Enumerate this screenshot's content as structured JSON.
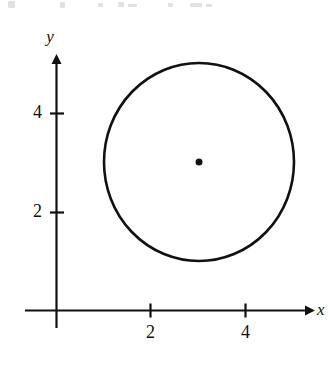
{
  "figure": {
    "background_color": "#ffffff",
    "ink_color": "#111111",
    "width": 335,
    "height": 368
  },
  "axes": {
    "x_axis_label": "x",
    "y_axis_label": "y",
    "x_ticks": [
      {
        "label": "2",
        "value": 2
      },
      {
        "label": "4",
        "value": 4
      }
    ],
    "y_ticks": [
      {
        "label": "2",
        "value": 2
      },
      {
        "label": "4",
        "value": 4
      }
    ],
    "origin_label": "",
    "x_arrowhead": "arrow-right",
    "y_arrowhead": "arrow-up"
  },
  "chart_data": {
    "type": "scatter",
    "xlabel": "x",
    "ylabel": "y",
    "xlim": [
      -0.65,
      5.4
    ],
    "ylim": [
      -0.35,
      5.15
    ],
    "grid": false,
    "legend": null,
    "x_ticks": [
      2,
      4
    ],
    "y_ticks": [
      2,
      4
    ],
    "x_tick_labels": [
      "2",
      "4"
    ],
    "y_tick_labels": [
      "2",
      "4"
    ],
    "series": [
      {
        "name": "circle",
        "type": "circle",
        "equation": "(x - 3)^2 + (y - 3)^2 = 4",
        "center": [
          3,
          3
        ],
        "radius": 2,
        "filled": false,
        "stroke_color": "#111111",
        "stroke_width": 2.6
      },
      {
        "name": "center-point",
        "type": "scatter",
        "x": [
          3
        ],
        "y": [
          3
        ],
        "marker": "filled-circle",
        "marker_size": 7,
        "color": "#111111"
      }
    ]
  },
  "scan_artifacts": {
    "description": "faint cropped text remnants along the top edge of the scan",
    "marks": [
      {
        "left": 8,
        "top": 1,
        "width": 7,
        "height": 7
      },
      {
        "left": 60,
        "top": 2,
        "width": 5,
        "height": 6
      },
      {
        "left": 98,
        "top": 3,
        "width": 5,
        "height": 4
      },
      {
        "left": 118,
        "top": 2,
        "width": 6,
        "height": 5
      },
      {
        "left": 128,
        "top": 4,
        "width": 9,
        "height": 3
      },
      {
        "left": 168,
        "top": 3,
        "width": 5,
        "height": 4
      },
      {
        "left": 190,
        "top": 3,
        "width": 12,
        "height": 4
      },
      {
        "left": 206,
        "top": 4,
        "width": 6,
        "height": 3
      }
    ]
  }
}
